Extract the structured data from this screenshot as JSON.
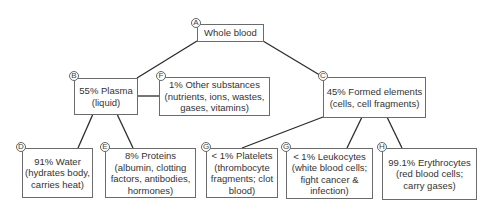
{
  "diagram": {
    "type": "hierarchy",
    "topic": "Composition of whole blood",
    "nodes": [
      {
        "id": "A",
        "badge": "A",
        "lines": [
          "Whole blood"
        ]
      },
      {
        "id": "B",
        "badge": "B",
        "lines": [
          "55% Plasma",
          "(liquid)"
        ]
      },
      {
        "id": "F",
        "badge": "F",
        "lines": [
          "1% Other substances",
          "(nutrients, ions, wastes,",
          "gases, vitamins)"
        ]
      },
      {
        "id": "C",
        "badge": "C",
        "lines": [
          "45% Formed elements",
          "(cells, cell fragments)"
        ]
      },
      {
        "id": "D",
        "badge": "D",
        "lines": [
          "91% Water",
          "(hydrates body,",
          "carries heat)"
        ]
      },
      {
        "id": "E",
        "badge": "E",
        "lines": [
          "8% Proteins",
          "(albumin, clotting",
          "factors, antibodies,",
          "hormones)"
        ]
      },
      {
        "id": "G1",
        "badge": "G",
        "lines": [
          "< 1% Platelets",
          "(thrombocyte",
          "fragments; clot",
          "blood)"
        ]
      },
      {
        "id": "G2",
        "badge": "G",
        "lines": [
          "< 1% Leukocytes",
          "(white blood cells;",
          "fight cancer &",
          "infection)"
        ]
      },
      {
        "id": "H",
        "badge": "H",
        "lines": [
          "99.1% Erythrocytes",
          "(red blood cells;",
          "carry gases)"
        ]
      }
    ],
    "edges": [
      {
        "from": "A",
        "to": "B"
      },
      {
        "from": "A",
        "to": "C"
      },
      {
        "from": "B",
        "to": "F"
      },
      {
        "from": "B",
        "to": "D"
      },
      {
        "from": "B",
        "to": "E"
      },
      {
        "from": "C",
        "to": "G1"
      },
      {
        "from": "C",
        "to": "G2"
      },
      {
        "from": "C",
        "to": "H"
      }
    ],
    "colors": {
      "line": "#2b2b2b",
      "border": "#6b6b6b",
      "text": "#333333"
    }
  }
}
